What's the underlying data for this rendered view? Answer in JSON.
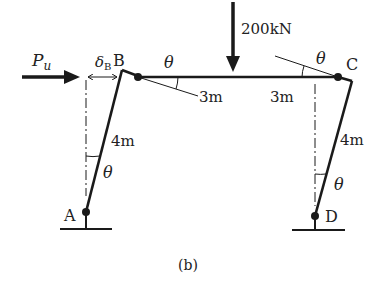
{
  "diagram": {
    "caption": "(b)",
    "load": {
      "label": "200kN"
    },
    "lateral_load": {
      "label_main": "P",
      "label_sub": "u"
    },
    "displacement": {
      "label_main": "δ",
      "label_sub": "B"
    },
    "nodes": {
      "A": "A",
      "B": "B",
      "C": "C",
      "D": "D"
    },
    "angles": {
      "theta": "θ"
    },
    "dimensions": {
      "left_column": "4m",
      "right_column": "4m",
      "beam_left": "3m",
      "beam_right": "3m"
    },
    "colors": {
      "line": "#1a1a1a",
      "text": "#222222",
      "background": "#ffffff"
    }
  }
}
